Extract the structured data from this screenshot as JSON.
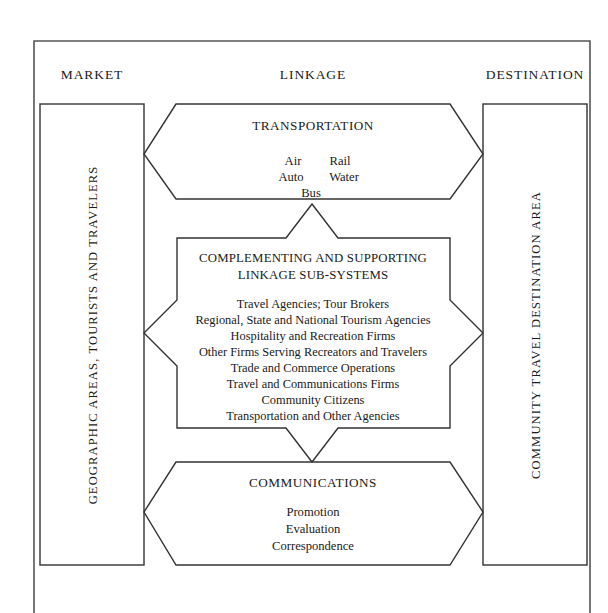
{
  "figure": {
    "columns": [
      {
        "key": "market",
        "label": "MARKET"
      },
      {
        "key": "linkage",
        "label": "LINKAGE"
      },
      {
        "key": "destination",
        "label": "DESTINATION"
      }
    ],
    "left_panel": {
      "label": "GEOGRAPHIC AREAS, TOURISTS AND TRAVELERS"
    },
    "right_panel": {
      "label": "COMMUNITY TRAVEL DESTINATION AREA"
    },
    "transportation": {
      "title": "TRANSPORTATION",
      "modes_row1": [
        "Air",
        "Rail"
      ],
      "modes_row2": [
        "Auto",
        "Water"
      ],
      "modes_row3": [
        "Bus"
      ]
    },
    "center": {
      "title_line1": "COMPLEMENTING AND SUPPORTING",
      "title_line2": "LINKAGE SUB-SYSTEMS",
      "items": [
        "Travel Agencies; Tour Brokers",
        "Regional, State and National Tourism Agencies",
        "Hospitality and Recreation Firms",
        "Other Firms Serving Recreators and Travelers",
        "Trade and Commerce Operations",
        "Travel and Communications Firms",
        "Community Citizens",
        "Transportation and Other Agencies"
      ]
    },
    "communications": {
      "title": "COMMUNICATIONS",
      "items": [
        "Promotion",
        "Evaluation",
        "Correspondence"
      ]
    },
    "colors": {
      "stroke": "#333333",
      "frame": "#555555",
      "text": "#1a1a1a",
      "background": "#ffffff"
    }
  }
}
